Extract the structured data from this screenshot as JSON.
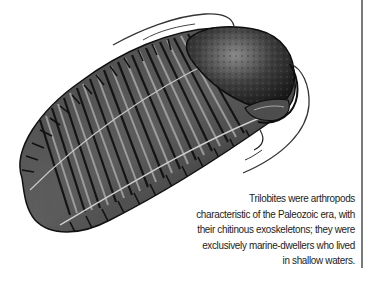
{
  "illustration": {
    "subject": "trilobite",
    "style": "grayscale engraving",
    "colors": {
      "dark": "#1e1e1e",
      "mid": "#5a5a5a",
      "light": "#b5b5b5",
      "background": "#ffffff"
    }
  },
  "caption": {
    "lines": [
      "Trilobites were arthropods",
      "characteristic of the Paleozoic era, with",
      "their chitinous exoskeletons; they were",
      "exclusively marine-dwellers who lived",
      "in shallow waters."
    ]
  },
  "rule": {
    "color": "#7a7a7a"
  }
}
